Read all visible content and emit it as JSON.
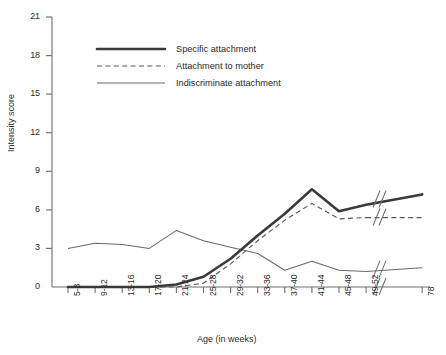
{
  "chart_data": {
    "type": "line",
    "title": "",
    "xlabel": "Age (in weeks)",
    "ylabel": "Intensity score",
    "categories": [
      "5-8",
      "9-12",
      "13-16",
      "17-20",
      "21-24",
      "25-28",
      "29-32",
      "33-36",
      "37-40",
      "41-44",
      "45-48",
      "49-52",
      "78"
    ],
    "x_axis_break_before_last": true,
    "ylim": [
      0,
      21
    ],
    "yticks": [
      0,
      3,
      6,
      9,
      12,
      15,
      18,
      21
    ],
    "grid": false,
    "legend_position": "upper-left-inside",
    "series": [
      {
        "name": "Specific attachment",
        "style": "thick-solid",
        "color": "#3a3a3a",
        "values": [
          0,
          0,
          0,
          0,
          0.2,
          0.8,
          2.2,
          4.0,
          5.7,
          7.6,
          5.9,
          6.4,
          7.2
        ]
      },
      {
        "name": "Attachment to mother",
        "style": "dashed",
        "color": "#5a5a5a",
        "values": [
          0,
          0,
          0,
          0,
          0,
          0.3,
          1.8,
          3.6,
          5.2,
          6.5,
          5.3,
          5.4,
          5.4
        ]
      },
      {
        "name": "Indiscriminate attachment",
        "style": "thin-solid",
        "color": "#6a6a6a",
        "values": [
          3.0,
          3.4,
          3.3,
          3.0,
          4.4,
          3.6,
          3.1,
          2.6,
          1.3,
          2.0,
          1.3,
          1.2,
          1.5
        ]
      }
    ]
  },
  "axis": {
    "y_label": "Intensity score",
    "x_label": "Age (in weeks)",
    "y_ticks": [
      "21",
      "18",
      "15",
      "12",
      "9",
      "6",
      "3",
      "0"
    ],
    "x_ticks": [
      "5-8",
      "9-12",
      "13-16",
      "17-20",
      "21-24",
      "25-28",
      "29-32",
      "33-36",
      "37-40",
      "41-44",
      "49-52",
      "45-48",
      "78"
    ]
  },
  "legend": {
    "items": [
      {
        "label": "Specific attachment"
      },
      {
        "label": "Attachment to mother"
      },
      {
        "label": "Indiscriminate attachment"
      }
    ]
  }
}
